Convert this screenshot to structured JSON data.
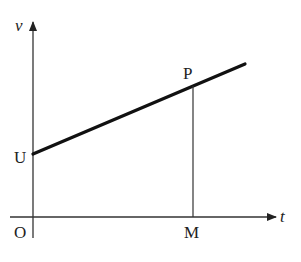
{
  "diagram": {
    "type": "velocity-time graph",
    "axes": {
      "y_label": "v",
      "x_label": "t",
      "origin_label": "O"
    },
    "points": {
      "U": "U",
      "P": "P",
      "M": "M"
    },
    "colors": {
      "line": "#111111",
      "axis": "#333333",
      "text": "#222222"
    }
  }
}
